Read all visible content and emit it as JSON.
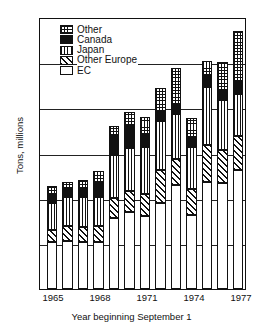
{
  "chart_data": {
    "type": "bar",
    "stacked": true,
    "title": "",
    "xlabel": "Year beginning September 1",
    "ylabel": "Tons, millions",
    "ylim": [
      0,
      18
    ],
    "yticks": [
      0,
      3,
      6,
      9,
      12,
      15,
      18
    ],
    "xticks": [
      "1965",
      "1968",
      "1971",
      "1974",
      "1977"
    ],
    "grid": true,
    "legend_position": "upper-left",
    "categories": [
      "1965",
      "1966",
      "1967",
      "1968",
      "1969",
      "1970",
      "1971",
      "1972",
      "1973",
      "1974",
      "1975",
      "1976",
      "1977"
    ],
    "series": [
      {
        "name": "EC",
        "pattern": "open-white",
        "values": [
          3.1,
          3.2,
          3.1,
          3.1,
          4.7,
          5.1,
          4.8,
          5.7,
          6.9,
          4.9,
          7.1,
          7.0,
          7.9
        ]
      },
      {
        "name": "Other Europe",
        "pattern": "diagonal-hatch",
        "values": [
          0.8,
          1.0,
          1.0,
          1.1,
          1.3,
          1.4,
          1.5,
          2.2,
          1.7,
          1.7,
          2.4,
          2.2,
          2.2
        ]
      },
      {
        "name": "Japan",
        "pattern": "vertical-lines",
        "values": [
          1.8,
          1.9,
          2.0,
          1.9,
          2.9,
          2.8,
          3.1,
          3.2,
          3.0,
          2.8,
          3.9,
          3.3,
          2.8
        ]
      },
      {
        "name": "Canada",
        "pattern": "solid-black",
        "values": [
          0.5,
          0.5,
          0.5,
          0.9,
          1.2,
          1.5,
          0.8,
          0.6,
          0.6,
          0.6,
          0.7,
          0.6,
          0.8
        ]
      },
      {
        "name": "Other",
        "pattern": "cross-dot",
        "values": [
          0.6,
          0.5,
          0.6,
          0.8,
          0.7,
          0.9,
          1.2,
          1.6,
          2.4,
          1.3,
          1.0,
          1.9,
          3.4
        ]
      }
    ],
    "totals": [
      6.8,
      7.1,
      7.2,
      7.8,
      10.8,
      11.7,
      11.4,
      13.3,
      14.6,
      11.3,
      15.1,
      15.0,
      17.1
    ]
  },
  "legend": {
    "items": [
      {
        "label": "Other",
        "swatch": "cross-dot-swatch"
      },
      {
        "label": "Canada",
        "swatch": "solid-black-swatch"
      },
      {
        "label": "Japan",
        "swatch": "vertical-lines-swatch"
      },
      {
        "label": "Other Europe",
        "swatch": "diagonal-hatch-swatch"
      },
      {
        "label": "EC",
        "swatch": "open-white-swatch"
      }
    ]
  },
  "axes": {
    "y_label": "Tons, millions",
    "x_label": "Year beginning September 1",
    "y_tick_labels": [
      "18",
      "15",
      "12",
      "9",
      "6",
      "3",
      "0"
    ],
    "x_tick_labels": [
      "1965",
      "1968",
      "1971",
      "1974",
      "1977"
    ]
  }
}
